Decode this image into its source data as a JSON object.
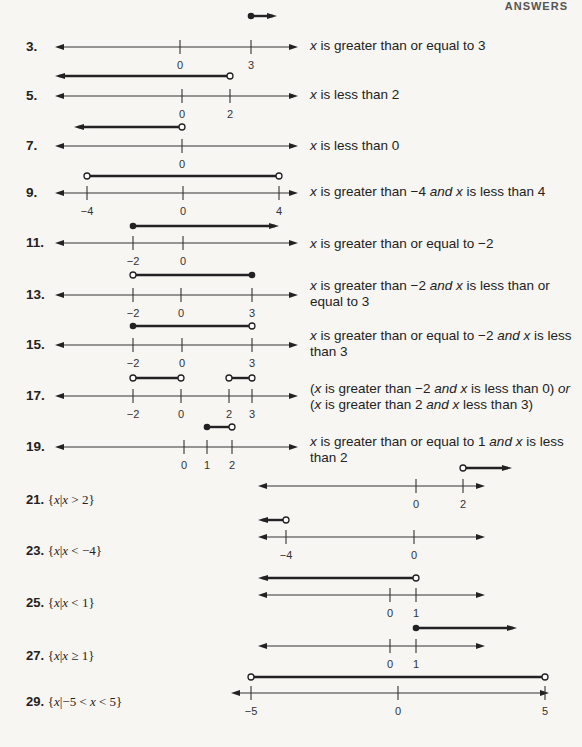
{
  "page": {
    "header_tag": "ANSWERS"
  },
  "problems": [
    {
      "number": "3.",
      "description": "x is greater than or equal to 3",
      "line": {
        "y": 47,
        "x0": 55,
        "x1": 298,
        "ticks": [
          {
            "v": "0",
            "x": 180
          },
          {
            "v": "3",
            "x": 251
          }
        ]
      },
      "graph": {
        "y": 16,
        "segments": [
          {
            "from": {
              "x": 251,
              "type": "closed"
            },
            "to": {
              "x": 277,
              "type": "arrow"
            }
          }
        ]
      },
      "desc_pos": {
        "x": 310,
        "y": 38
      }
    },
    {
      "number": "5.",
      "description": "x is less than 2",
      "line": {
        "y": 96,
        "x0": 55,
        "x1": 298,
        "ticks": [
          {
            "v": "0",
            "x": 182
          },
          {
            "v": "2",
            "x": 230
          }
        ]
      },
      "graph": {
        "y": 76,
        "segments": [
          {
            "from": {
              "x": 55,
              "type": "arrow"
            },
            "to": {
              "x": 230,
              "type": "open"
            }
          }
        ]
      },
      "desc_pos": {
        "x": 310,
        "y": 87
      }
    },
    {
      "number": "7.",
      "description": "x is less than 0",
      "line": {
        "y": 146,
        "x0": 55,
        "x1": 298,
        "ticks": [
          {
            "v": "0",
            "x": 182
          }
        ]
      },
      "graph": {
        "y": 127,
        "segments": [
          {
            "from": {
              "x": 74,
              "type": "arrow"
            },
            "to": {
              "x": 182,
              "type": "open"
            }
          }
        ]
      },
      "desc_pos": {
        "x": 310,
        "y": 138
      }
    },
    {
      "number": "9.",
      "description": "x is greater than −4 and x is less than 4",
      "line": {
        "y": 193,
        "x0": 55,
        "x1": 298,
        "ticks": [
          {
            "v": "−4",
            "x": 87
          },
          {
            "v": "0",
            "x": 183
          },
          {
            "v": "4",
            "x": 279
          }
        ]
      },
      "graph": {
        "y": 176,
        "segments": [
          {
            "from": {
              "x": 87,
              "type": "open"
            },
            "to": {
              "x": 279,
              "type": "open"
            }
          }
        ]
      },
      "desc_pos": {
        "x": 310,
        "y": 184
      }
    },
    {
      "number": "11.",
      "description": "x is greater than or equal to −2",
      "line": {
        "y": 243,
        "x0": 55,
        "x1": 298,
        "ticks": [
          {
            "v": "−2",
            "x": 133
          },
          {
            "v": "0",
            "x": 183
          }
        ]
      },
      "graph": {
        "y": 226,
        "segments": [
          {
            "from": {
              "x": 133,
              "type": "closed"
            },
            "to": {
              "x": 279,
              "type": "arrow"
            }
          }
        ]
      },
      "desc_pos": {
        "x": 310,
        "y": 236
      }
    },
    {
      "number": "13.",
      "description": "x is greater than −2 and x is less than or equal to 3",
      "line": {
        "y": 295,
        "x0": 55,
        "x1": 298,
        "ticks": [
          {
            "v": "−2",
            "x": 133
          },
          {
            "v": "0",
            "x": 181
          },
          {
            "v": "3",
            "x": 252
          }
        ]
      },
      "graph": {
        "y": 275,
        "segments": [
          {
            "from": {
              "x": 133,
              "type": "open"
            },
            "to": {
              "x": 252,
              "type": "closed"
            }
          }
        ]
      },
      "desc_pos": {
        "x": 310,
        "y": 278
      }
    },
    {
      "number": "15.",
      "description": "x is greater than or equal to −2 and x is less than 3",
      "line": {
        "y": 345,
        "x0": 55,
        "x1": 298,
        "ticks": [
          {
            "v": "−2",
            "x": 133
          },
          {
            "v": "0",
            "x": 182
          },
          {
            "v": "3",
            "x": 252
          }
        ]
      },
      "graph": {
        "y": 326,
        "segments": [
          {
            "from": {
              "x": 133,
              "type": "closed"
            },
            "to": {
              "x": 252,
              "type": "open"
            }
          }
        ]
      },
      "desc_pos": {
        "x": 310,
        "y": 328
      }
    },
    {
      "number": "17.",
      "description": "(x is greater than −2 and x is less than 0) or (x is greater than 2 and x less than 3)",
      "line": {
        "y": 396,
        "x0": 55,
        "x1": 298,
        "ticks": [
          {
            "v": "−2",
            "x": 133
          },
          {
            "v": "0",
            "x": 181
          },
          {
            "v": "2",
            "x": 229
          },
          {
            "v": "3",
            "x": 252
          }
        ]
      },
      "graph": {
        "y": 378,
        "segments": [
          {
            "from": {
              "x": 133,
              "type": "open"
            },
            "to": {
              "x": 181,
              "type": "open"
            }
          },
          {
            "from": {
              "x": 229,
              "type": "open"
            },
            "to": {
              "x": 252,
              "type": "open"
            }
          }
        ]
      },
      "desc_pos": {
        "x": 310,
        "y": 381
      }
    },
    {
      "number": "19.",
      "description": "x is greater than or equal to 1 and x is less than 2",
      "line": {
        "y": 447,
        "x0": 55,
        "x1": 298,
        "ticks": [
          {
            "v": "0",
            "x": 184
          },
          {
            "v": "1",
            "x": 207
          },
          {
            "v": "2",
            "x": 232
          }
        ]
      },
      "graph": {
        "y": 427,
        "segments": [
          {
            "from": {
              "x": 207,
              "type": "closed"
            },
            "to": {
              "x": 232,
              "type": "open"
            }
          }
        ]
      },
      "desc_pos": {
        "x": 310,
        "y": 434
      }
    },
    {
      "number": "21.",
      "set_notation": "{x|x > 2}",
      "line": {
        "y": 486,
        "x0": 258,
        "x1": 485,
        "ticks": [
          {
            "v": "0",
            "x": 416
          },
          {
            "v": "2",
            "x": 463
          }
        ]
      },
      "graph": {
        "y": 468,
        "segments": [
          {
            "from": {
              "x": 463,
              "type": "open"
            },
            "to": {
              "x": 512,
              "type": "arrow"
            }
          }
        ]
      },
      "label_pos": {
        "x": 26,
        "y": 500
      }
    },
    {
      "number": "23.",
      "set_notation": "{x|x < −4}",
      "line": {
        "y": 537,
        "x0": 258,
        "x1": 485,
        "ticks": [
          {
            "v": "−4",
            "x": 286
          },
          {
            "v": "0",
            "x": 414
          }
        ]
      },
      "graph": {
        "y": 520,
        "segments": [
          {
            "from": {
              "x": 258,
              "type": "arrow"
            },
            "to": {
              "x": 286,
              "type": "open"
            }
          }
        ]
      },
      "label_pos": {
        "x": 26,
        "y": 551
      }
    },
    {
      "number": "25.",
      "set_notation": "{x|x < 1}",
      "line": {
        "y": 595,
        "x0": 258,
        "x1": 485,
        "ticks": [
          {
            "v": "0",
            "x": 390
          },
          {
            "v": "1",
            "x": 416
          }
        ]
      },
      "graph": {
        "y": 578,
        "segments": [
          {
            "from": {
              "x": 258,
              "type": "arrow"
            },
            "to": {
              "x": 416,
              "type": "open"
            }
          }
        ]
      },
      "label_pos": {
        "x": 26,
        "y": 603
      }
    },
    {
      "number": "27.",
      "set_notation": "{x|x ≥ 1}",
      "line": {
        "y": 646,
        "x0": 258,
        "x1": 485,
        "ticks": [
          {
            "v": "0",
            "x": 390
          },
          {
            "v": "1",
            "x": 416
          }
        ]
      },
      "graph": {
        "y": 628,
        "segments": [
          {
            "from": {
              "x": 416,
              "type": "closed"
            },
            "to": {
              "x": 517,
              "type": "arrow"
            }
          }
        ]
      },
      "label_pos": {
        "x": 26,
        "y": 656
      }
    },
    {
      "number": "29.",
      "set_notation": "{x|−5 < x < 5}",
      "line": {
        "y": 693,
        "x0": 231,
        "x1": 549,
        "ticks": [
          {
            "v": "−5",
            "x": 251
          },
          {
            "v": "0",
            "x": 398
          },
          {
            "v": "5",
            "x": 545
          }
        ]
      },
      "graph": {
        "y": 677,
        "segments": [
          {
            "from": {
              "x": 251,
              "type": "open"
            },
            "to": {
              "x": 545,
              "type": "open"
            }
          }
        ]
      },
      "label_pos": {
        "x": 26,
        "y": 702
      }
    }
  ]
}
